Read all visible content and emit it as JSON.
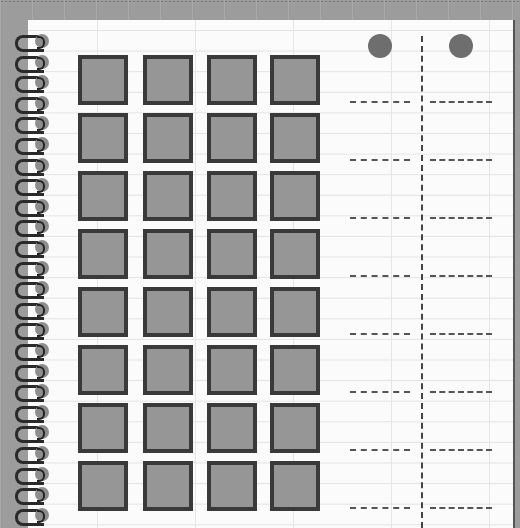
{
  "game": {
    "grid": {
      "rows": 8,
      "cols": 4,
      "square_color": "#969696",
      "border_color": "#3a3a3a"
    },
    "header_markers": [
      {
        "x": 380,
        "color": "#6e6e6e"
      },
      {
        "x": 461,
        "color": "#6e6e6e"
      }
    ],
    "answer_columns": 2,
    "answer_slots_per_column": 8,
    "spiral_rings": 24
  }
}
